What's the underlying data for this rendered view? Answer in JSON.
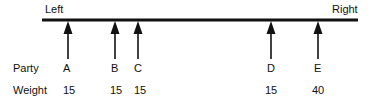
{
  "diagram": {
    "left_label": "Left",
    "right_label": "Right",
    "row_labels": {
      "party": "Party",
      "weight": "Weight"
    },
    "parties": [
      {
        "name": "A",
        "weight": "15",
        "x": 68
      },
      {
        "name": "B",
        "weight": "15",
        "x": 115
      },
      {
        "name": "C",
        "weight": "15",
        "x": 138
      },
      {
        "name": "D",
        "weight": "15",
        "x": 271
      },
      {
        "name": "E",
        "weight": "40",
        "x": 318
      }
    ],
    "line_color": "#111111"
  }
}
